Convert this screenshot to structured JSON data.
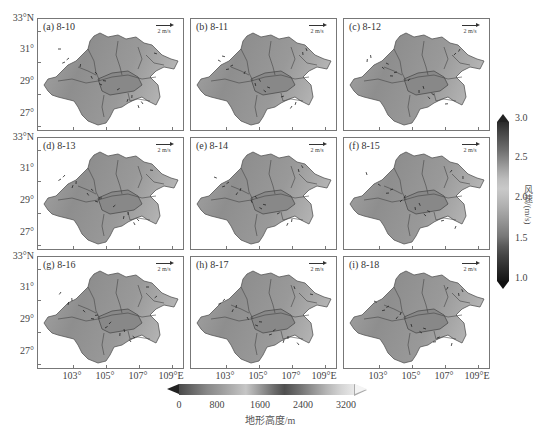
{
  "figure": {
    "panels": [
      {
        "label": "(a) 8-10",
        "vector_key": "2 m/s"
      },
      {
        "label": "(b) 8-11",
        "vector_key": "2 m/s"
      },
      {
        "label": "(c) 8-12",
        "vector_key": "2 m/s"
      },
      {
        "label": "(d) 8-13",
        "vector_key": "2 m/s"
      },
      {
        "label": "(e) 8-14",
        "vector_key": "2 m/s"
      },
      {
        "label": "(f) 8-15",
        "vector_key": "2 m/s"
      },
      {
        "label": "(g) 8-16",
        "vector_key": "2 m/s"
      },
      {
        "label": "(h) 8-17",
        "vector_key": "2 m/s"
      },
      {
        "label": "(i) 8-18",
        "vector_key": "2 m/s"
      }
    ],
    "y_axis_labels": [
      "33°N",
      "31°",
      "29°",
      "27°"
    ],
    "x_axis_labels": [
      "103°",
      "105°",
      "107°",
      "109°E"
    ],
    "wind_colorbar": {
      "title": "风速/(m/s)",
      "ticks": [
        "3.0",
        "2.5",
        "2.0",
        "1.5",
        "1.0"
      ],
      "min": 1.0,
      "max": 3.0
    },
    "terrain_colorbar": {
      "title": "地形高度/m",
      "ticks": [
        "0",
        "800",
        "1600",
        "2400",
        "3200"
      ],
      "min": 0,
      "max": 3200
    },
    "colors": {
      "frame": "#777777",
      "basin_fill": "#8c8c8c",
      "highland_fill": "#a8a8a8",
      "boundary_line": "#444444"
    }
  }
}
